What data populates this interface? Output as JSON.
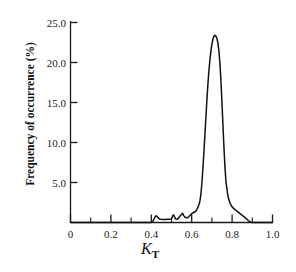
{
  "chart_data": {
    "type": "line",
    "title": "",
    "subtitle": "",
    "xlabel": "K_T",
    "xlabel_base": "K",
    "xlabel_sub": "T",
    "ylabel": "Frequency of occurrence (%)",
    "xlim": [
      0,
      1.0
    ],
    "ylim": [
      0,
      25.0
    ],
    "grid": false,
    "legend": "none",
    "x_ticks": [
      0,
      0.2,
      0.4,
      0.6,
      0.8,
      1.0
    ],
    "x_tick_labels": [
      "0",
      "0.2",
      "0.4",
      "0.6",
      "0.8",
      "1.0"
    ],
    "x_minor_ticks": [
      0.1,
      0.3,
      0.5,
      0.7,
      0.9
    ],
    "y_ticks": [
      5.0,
      10.0,
      15.0,
      20.0,
      25.0
    ],
    "y_tick_labels": [
      "5.0",
      "10.0",
      "15.0",
      "20.0",
      "25.0"
    ],
    "series_name": "Frequency of occurrence",
    "curve_color": "#111111",
    "axis_color": "#1a1a1a",
    "background_color": "#ffffff",
    "peak_x": 0.71,
    "peak_y": 23.4,
    "x": [
      0.0,
      0.05,
      0.1,
      0.15,
      0.2,
      0.25,
      0.3,
      0.33,
      0.36,
      0.38,
      0.4,
      0.41,
      0.42,
      0.425,
      0.43,
      0.44,
      0.45,
      0.46,
      0.47,
      0.48,
      0.49,
      0.5,
      0.505,
      0.51,
      0.515,
      0.52,
      0.53,
      0.535,
      0.54,
      0.55,
      0.555,
      0.56,
      0.565,
      0.57,
      0.58,
      0.585,
      0.59,
      0.6,
      0.61,
      0.62,
      0.625,
      0.63,
      0.635,
      0.64,
      0.645,
      0.65,
      0.655,
      0.66,
      0.665,
      0.67,
      0.675,
      0.68,
      0.685,
      0.69,
      0.695,
      0.7,
      0.705,
      0.71,
      0.715,
      0.72,
      0.725,
      0.73,
      0.735,
      0.74,
      0.745,
      0.75,
      0.755,
      0.76,
      0.765,
      0.77,
      0.78,
      0.79,
      0.8,
      0.81,
      0.82,
      0.83,
      0.84,
      0.85,
      0.86,
      0.87,
      0.88,
      0.89,
      0.9,
      0.95,
      1.0
    ],
    "y": [
      0.0,
      0.0,
      0.0,
      0.0,
      0.0,
      0.0,
      0.0,
      0.0,
      0.0,
      0.0,
      0.0,
      0.25,
      0.75,
      0.85,
      0.7,
      0.45,
      0.4,
      0.38,
      0.38,
      0.4,
      0.42,
      0.45,
      0.8,
      0.95,
      0.7,
      0.45,
      0.42,
      0.55,
      0.75,
      1.0,
      1.15,
      0.9,
      0.7,
      0.62,
      0.6,
      0.72,
      0.85,
      1.1,
      1.25,
      1.4,
      1.6,
      1.85,
      2.2,
      2.6,
      3.4,
      4.8,
      6.6,
      8.6,
      10.8,
      13.0,
      15.2,
      17.2,
      18.9,
      20.3,
      21.4,
      22.3,
      22.9,
      23.3,
      23.4,
      23.3,
      23.0,
      22.4,
      21.4,
      19.8,
      17.6,
      14.9,
      12.0,
      9.2,
      6.8,
      5.0,
      3.2,
      2.4,
      1.95,
      1.7,
      1.5,
      1.3,
      1.1,
      0.9,
      0.7,
      0.48,
      0.25,
      0.05,
      0.0,
      0.0,
      0.0
    ]
  },
  "axes": {
    "y_axis_name": "frequency-axis",
    "x_axis_name": "kt-axis"
  }
}
